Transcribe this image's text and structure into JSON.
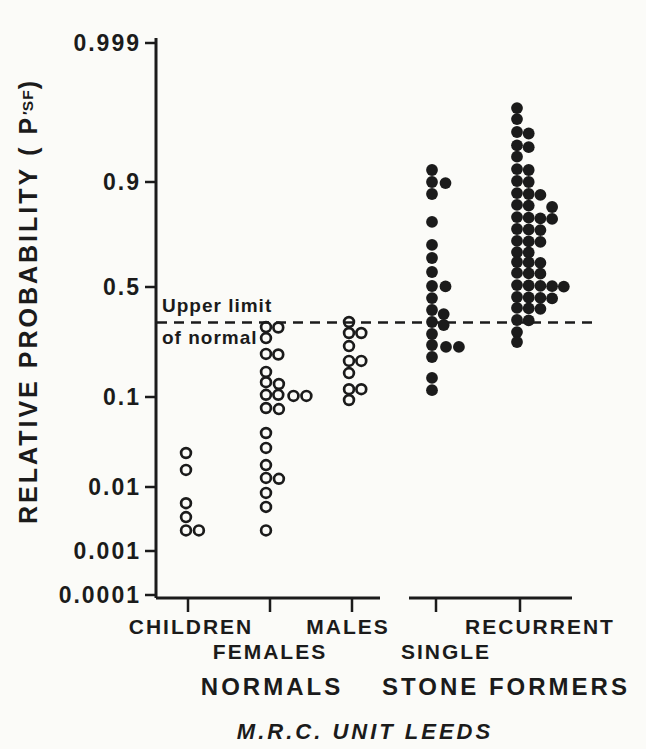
{
  "figure": {
    "background": "#fbfbf8",
    "ink": "#1b1b1b",
    "caption": "M.R.C. UNIT LEEDS"
  },
  "chart_data": {
    "type": "scatter",
    "title": "",
    "y_axis": {
      "title": "RELATIVE PROBABILITY",
      "symbol_paren_open": "( P",
      "symbol_prime": "′",
      "symbol_subscript": "SF",
      "symbol_paren_close": ")",
      "scale": "probability (logit spacing)",
      "tick_values": [
        0.999,
        0.9,
        0.5,
        0.1,
        0.01,
        0.001,
        0.0001
      ],
      "tick_labels": [
        "0.999",
        "0.9",
        "0.5",
        "0.1",
        "0.01",
        "0.001",
        "0.0001"
      ]
    },
    "reference_line": {
      "value": 0.33,
      "style": "dashed",
      "label_line1": "Upper limit",
      "label_line2": "of normal"
    },
    "groups": [
      {
        "label": "NORMALS",
        "categories": [
          {
            "label": "CHILDREN",
            "marker": "open-circle",
            "points": [
              {
                "p": 0.0244,
                "dx": 0
              },
              {
                "p": 0.0157,
                "dx": 0
              },
              {
                "p": 0.0056,
                "dx": 0
              },
              {
                "p": 0.0034,
                "dx": 0
              },
              {
                "p": 0.0021,
                "dx": 0
              },
              {
                "p": 0.0021,
                "dx": 1.1
              }
            ]
          },
          {
            "label": "FEMALES",
            "marker": "open-circle",
            "points": [
              {
                "p": 0.31,
                "dx": 0
              },
              {
                "p": 0.308,
                "dx": 1.05
              },
              {
                "p": 0.265,
                "dx": 0
              },
              {
                "p": 0.208,
                "dx": 0
              },
              {
                "p": 0.206,
                "dx": 1.05
              },
              {
                "p": 0.155,
                "dx": 0
              },
              {
                "p": 0.13,
                "dx": 0
              },
              {
                "p": 0.126,
                "dx": 1.1
              },
              {
                "p": 0.104,
                "dx": 0
              },
              {
                "p": 0.104,
                "dx": 1.05
              },
              {
                "p": 0.102,
                "dx": 2.35
              },
              {
                "p": 0.102,
                "dx": 3.45
              },
              {
                "p": 0.0765,
                "dx": 0
              },
              {
                "p": 0.0745,
                "dx": 1.1
              },
              {
                "p": 0.0408,
                "dx": 0
              },
              {
                "p": 0.0278,
                "dx": 0
              },
              {
                "p": 0.0178,
                "dx": 0
              },
              {
                "p": 0.0127,
                "dx": 0
              },
              {
                "p": 0.0124,
                "dx": 1.1
              },
              {
                "p": 0.0081,
                "dx": 0
              },
              {
                "p": 0.0049,
                "dx": 0
              },
              {
                "p": 0.0021,
                "dx": 0
              }
            ]
          },
          {
            "label": "MALES",
            "marker": "open-circle",
            "points": [
              {
                "p": 0.332,
                "dx": 0
              },
              {
                "p": 0.285,
                "dx": 0
              },
              {
                "p": 0.285,
                "dx": 1.05
              },
              {
                "p": 0.235,
                "dx": 0
              },
              {
                "p": 0.186,
                "dx": 0
              },
              {
                "p": 0.186,
                "dx": 1.05
              },
              {
                "p": 0.152,
                "dx": 0
              },
              {
                "p": 0.115,
                "dx": 0
              },
              {
                "p": 0.115,
                "dx": 1.05
              },
              {
                "p": 0.093,
                "dx": 0
              }
            ]
          }
        ]
      },
      {
        "label": "STONE FORMERS",
        "categories": [
          {
            "label": "SINGLE",
            "marker": "filled-circle",
            "points": [
              {
                "p": 0.931,
                "dx": 0
              },
              {
                "p": 0.9,
                "dx": 0
              },
              {
                "p": 0.898,
                "dx": 1.15
              },
              {
                "p": 0.875,
                "dx": 0
              },
              {
                "p": 0.796,
                "dx": 0
              },
              {
                "p": 0.707,
                "dx": 0
              },
              {
                "p": 0.647,
                "dx": 0
              },
              {
                "p": 0.578,
                "dx": 0
              },
              {
                "p": 0.505,
                "dx": 0
              },
              {
                "p": 0.503,
                "dx": 1.15
              },
              {
                "p": 0.445,
                "dx": 0
              },
              {
                "p": 0.387,
                "dx": 0
              },
              {
                "p": 0.368,
                "dx": 1.0
              },
              {
                "p": 0.332,
                "dx": 0
              },
              {
                "p": 0.319,
                "dx": 1.0
              },
              {
                "p": 0.281,
                "dx": 0
              },
              {
                "p": 0.239,
                "dx": 0
              },
              {
                "p": 0.232,
                "dx": 1.2
              },
              {
                "p": 0.232,
                "dx": 2.3
              },
              {
                "p": 0.198,
                "dx": 0
              },
              {
                "p": 0.14,
                "dx": 0
              },
              {
                "p": 0.113,
                "dx": 0
              }
            ]
          },
          {
            "label": "RECURRENT",
            "marker": "filled-circle",
            "points": [
              {
                "p": 0.991,
                "dx": 0
              },
              {
                "p": 0.987,
                "dx": 0
              },
              {
                "p": 0.98,
                "dx": 0
              },
              {
                "p": 0.979,
                "dx": 1
              },
              {
                "p": 0.969,
                "dx": 0
              },
              {
                "p": 0.967,
                "dx": 1
              },
              {
                "p": 0.955,
                "dx": 0
              },
              {
                "p": 0.933,
                "dx": 0
              },
              {
                "p": 0.931,
                "dx": 1
              },
              {
                "p": 0.903,
                "dx": 0
              },
              {
                "p": 0.9,
                "dx": 1
              },
              {
                "p": 0.877,
                "dx": 0
              },
              {
                "p": 0.875,
                "dx": 1
              },
              {
                "p": 0.873,
                "dx": 2
              },
              {
                "p": 0.848,
                "dx": 0
              },
              {
                "p": 0.846,
                "dx": 1
              },
              {
                "p": 0.842,
                "dx": 3
              },
              {
                "p": 0.812,
                "dx": 0
              },
              {
                "p": 0.81,
                "dx": 1
              },
              {
                "p": 0.808,
                "dx": 2
              },
              {
                "p": 0.806,
                "dx": 3
              },
              {
                "p": 0.771,
                "dx": 0
              },
              {
                "p": 0.769,
                "dx": 1
              },
              {
                "p": 0.767,
                "dx": 2
              },
              {
                "p": 0.724,
                "dx": 0
              },
              {
                "p": 0.722,
                "dx": 1
              },
              {
                "p": 0.72,
                "dx": 2
              },
              {
                "p": 0.675,
                "dx": 0
              },
              {
                "p": 0.673,
                "dx": 1
              },
              {
                "p": 0.628,
                "dx": 0
              },
              {
                "p": 0.626,
                "dx": 1
              },
              {
                "p": 0.624,
                "dx": 2
              },
              {
                "p": 0.573,
                "dx": 0
              },
              {
                "p": 0.571,
                "dx": 1
              },
              {
                "p": 0.569,
                "dx": 2
              },
              {
                "p": 0.51,
                "dx": 0
              },
              {
                "p": 0.508,
                "dx": 1
              },
              {
                "p": 0.506,
                "dx": 2
              },
              {
                "p": 0.504,
                "dx": 3
              },
              {
                "p": 0.502,
                "dx": 4
              },
              {
                "p": 0.45,
                "dx": 0
              },
              {
                "p": 0.448,
                "dx": 1
              },
              {
                "p": 0.446,
                "dx": 2
              },
              {
                "p": 0.444,
                "dx": 3
              },
              {
                "p": 0.397,
                "dx": 0
              },
              {
                "p": 0.395,
                "dx": 1
              },
              {
                "p": 0.393,
                "dx": 2
              },
              {
                "p": 0.341,
                "dx": 0
              },
              {
                "p": 0.339,
                "dx": 1
              },
              {
                "p": 0.289,
                "dx": 0
              },
              {
                "p": 0.25,
                "dx": 0
              }
            ]
          }
        ]
      }
    ]
  }
}
